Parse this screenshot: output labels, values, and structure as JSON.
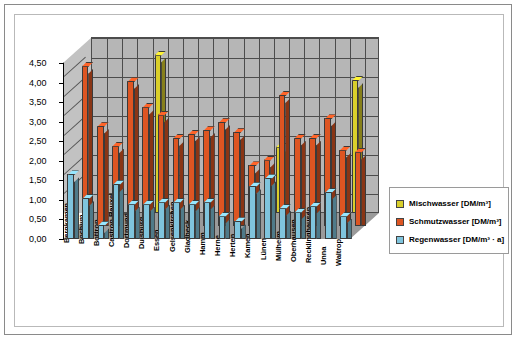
{
  "chart_data": {
    "type": "bar",
    "title": "",
    "subtitle": "",
    "xlabel": "",
    "ylabel": "",
    "ylim": [
      0,
      4.5
    ],
    "ytick_labels": [
      "0,00",
      "0,50",
      "1,00",
      "1,50",
      "2,00",
      "2,50",
      "3,00",
      "3,50",
      "4,00",
      "4,50"
    ],
    "ytick_values": [
      0,
      0.5,
      1.0,
      1.5,
      2.0,
      2.5,
      3.0,
      3.5,
      4.0,
      4.5
    ],
    "grid": true,
    "legend_position": "right",
    "style": "3d-grouped-columns",
    "categories": [
      "Bergkamen",
      "Bochum",
      "Bottrop",
      "Castrop-Rauxel",
      "Dortmund",
      "Duisburg",
      "Essen",
      "Gelsenkirchen",
      "Gladbeck",
      "Hamm",
      "Herne",
      "Herten",
      "Kamen",
      "Lünen",
      "Mülheim",
      "Oberhausen",
      "Recklinghausen",
      "Unna",
      "Waltrop"
    ],
    "series": [
      {
        "name": "Mischwasser [DM/m³]",
        "color": "#d9cf2b",
        "values": [
          0,
          0,
          0,
          0,
          4.05,
          0,
          0,
          0,
          0,
          0,
          0,
          0,
          1.7,
          0,
          0,
          0,
          0,
          3.4,
          0
        ]
      },
      {
        "name": "Schmutzwasser [DM/m³]",
        "color": "#dd5522",
        "values": [
          4.1,
          2.55,
          2.05,
          3.7,
          3.05,
          2.85,
          2.25,
          2.35,
          2.45,
          2.65,
          2.4,
          1.55,
          1.7,
          3.35,
          2.25,
          2.25,
          2.75,
          1.95,
          1.9
        ]
      },
      {
        "name": "Regenwasser [DM/m³ · a]",
        "color": "#7fc4dd",
        "values": [
          1.65,
          1.05,
          0.35,
          1.4,
          0.9,
          0.9,
          0.95,
          0.95,
          0.9,
          0.95,
          0.6,
          0.45,
          1.35,
          1.55,
          0.8,
          0.7,
          0.85,
          1.2,
          0.6
        ]
      }
    ]
  },
  "legend": {
    "items": [
      {
        "label": "Mischwasser [DM/m³]",
        "color": "#d9cf2b"
      },
      {
        "label": "Schmutzwasser [DM/m³]",
        "color": "#dd5522"
      },
      {
        "label": "Regenwasser [DM/m³ · a]",
        "color": "#7fc4dd"
      }
    ]
  }
}
